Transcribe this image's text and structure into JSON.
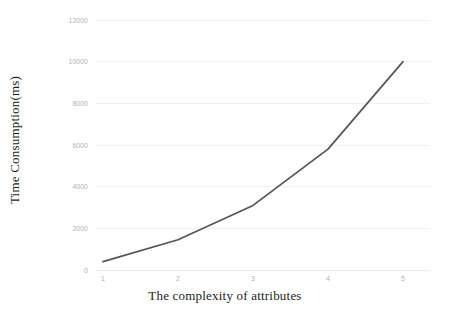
{
  "chart_data": {
    "type": "line",
    "title": "",
    "xlabel": "The complexity of attributes",
    "ylabel": "Time Consumption(ms)",
    "x": [
      1,
      2,
      3,
      4,
      5
    ],
    "categories": [
      "1",
      "2",
      "3",
      "4",
      "5"
    ],
    "values": [
      400,
      1450,
      3100,
      5800,
      10000
    ],
    "series": [
      {
        "name": "Time Consumption",
        "values": [
          400,
          1450,
          3100,
          5800,
          10000
        ]
      }
    ],
    "xlim": [
      1,
      5
    ],
    "ylim": [
      0,
      12000
    ],
    "ytick_labels": [
      "0",
      "2000",
      "4000",
      "6000",
      "8000",
      "10000",
      "12000"
    ],
    "ytick_values": [
      0,
      2000,
      4000,
      6000,
      8000,
      10000,
      12000
    ],
    "xtick_labels": [
      "1",
      "2",
      "3",
      "4",
      "5"
    ],
    "grid": true,
    "grid_axis": "y",
    "legend": false,
    "legend_position": "none",
    "line_color": "#555555",
    "grid_color": "#f1f1f1",
    "tick_label_color": "#b2b2b2",
    "axis_title_color": "#1c1c1c",
    "background_color": "#ffffff",
    "markers": false
  }
}
